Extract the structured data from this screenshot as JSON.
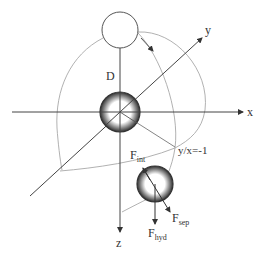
{
  "diagram": {
    "axes": {
      "x_label": "x",
      "y_label": "y",
      "z_label": "z"
    },
    "labels": {
      "distance": "D",
      "boundary": "y/x=-1",
      "force_int_main": "F",
      "force_int_sub": "int",
      "force_sep_main": "F",
      "force_sep_sub": "sep",
      "force_hyd_main": "F",
      "force_hyd_sub": "hyd"
    },
    "elements": {
      "top_particle": "open circle (orbiting particle)",
      "center_particle": "hatched sphere at origin",
      "lower_particle": "hatched sphere with force vectors"
    },
    "colors": {
      "axis": "#444444",
      "orbit": "#9a9a9a",
      "particle_shade": "#3a3a3a"
    }
  }
}
